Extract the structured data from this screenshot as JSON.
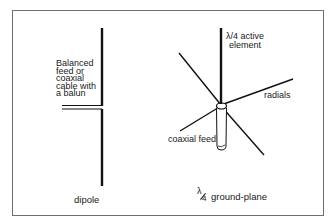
{
  "diagram": {
    "dipole": {
      "title": "dipole",
      "feed_label_lines": [
        "Balanced",
        "feed or",
        "coaxial",
        "cable with",
        "a balun"
      ]
    },
    "ground_plane": {
      "title_fraction_numerator": "λ",
      "title_fraction_denominator": "4",
      "title_text": "ground-plane",
      "active_element_lines": [
        "λ/4 active",
        "element"
      ],
      "radials_label": "radials",
      "coax_label": "coaxial feed"
    },
    "colors": {
      "line": "#111111",
      "frame": "#6e6e6e",
      "background": "#ffffff"
    }
  }
}
